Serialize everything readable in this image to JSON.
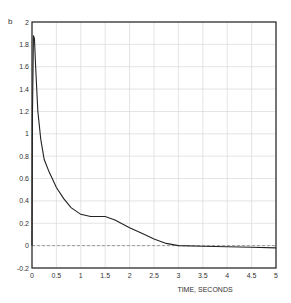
{
  "chart_data": {
    "type": "line",
    "panel_label": "b",
    "title": "",
    "xlabel": "TIME, SECONDS",
    "ylabel": "",
    "xlim": [
      0,
      5
    ],
    "ylim": [
      -0.2,
      2
    ],
    "xticks": [
      "0",
      "0.5",
      "1",
      "1.5",
      "2",
      "2.5",
      "3",
      "3.5",
      "4",
      "4.5",
      "5"
    ],
    "yticks": [
      "-0.2",
      "0",
      "0.2",
      "0.4",
      "0.6",
      "0.8",
      "1",
      "1.2",
      "1.4",
      "1.6",
      "1.8",
      "2"
    ],
    "xtick_values": [
      0,
      0.5,
      1,
      1.5,
      2,
      2.5,
      3,
      3.5,
      4,
      4.5,
      5
    ],
    "ytick_values": [
      -0.2,
      0,
      0.2,
      0.4,
      0.6,
      0.8,
      1,
      1.2,
      1.4,
      1.6,
      1.8,
      2
    ],
    "grid": true,
    "zero_line": "dashed",
    "series": [
      {
        "name": "response",
        "x": [
          0,
          0.01,
          0.03,
          0.05,
          0.08,
          0.12,
          0.18,
          0.25,
          0.35,
          0.5,
          0.65,
          0.8,
          1.0,
          1.2,
          1.4,
          1.5,
          1.7,
          2.0,
          2.25,
          2.5,
          2.75,
          3.0,
          3.5,
          4.0,
          4.5,
          5.0
        ],
        "y": [
          0.0,
          1.2,
          1.88,
          1.85,
          1.55,
          1.2,
          0.95,
          0.77,
          0.66,
          0.52,
          0.42,
          0.34,
          0.28,
          0.26,
          0.26,
          0.26,
          0.23,
          0.16,
          0.11,
          0.06,
          0.02,
          0.0,
          -0.005,
          -0.01,
          -0.015,
          -0.02
        ]
      }
    ]
  }
}
